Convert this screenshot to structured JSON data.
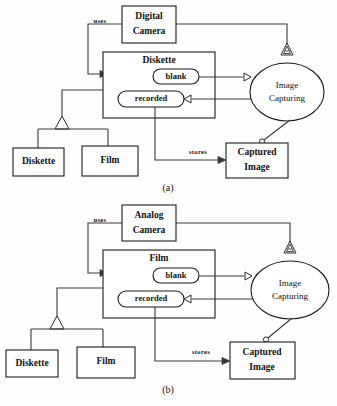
{
  "figure": {
    "type": "uml-object-diagram-pair",
    "panels": [
      {
        "id": "panel-a",
        "caption": "(a)",
        "caption_x": 168,
        "caption_y": 189,
        "nodes": {
          "camera": {
            "label_line1": "Digital",
            "label_line2": "Camera",
            "x": 122,
            "y": 6,
            "w": 54,
            "h": 37
          },
          "container_class": {
            "label": "Diskette",
            "x": 103,
            "y": 52,
            "w": 112,
            "h": 66
          },
          "attr_blank": {
            "label": "blank",
            "x": 153,
            "y": 69,
            "w": 46,
            "h": 15
          },
          "attr_recorded": {
            "label": "recorded",
            "x": 118,
            "y": 91,
            "w": 66,
            "h": 16
          },
          "use_case": {
            "label_line1": "Image",
            "label_line2": "Capturing",
            "cx": 287,
            "cy": 92,
            "rx": 37,
            "ry": 29
          },
          "captured_image": {
            "label_line1": "Captured",
            "label_line2": "Image",
            "x": 226,
            "y": 143,
            "w": 62,
            "h": 35
          },
          "sub_diskette": {
            "label": "Diskette",
            "x": 13,
            "y": 148,
            "w": 51,
            "h": 28
          },
          "sub_film": {
            "label": "Film",
            "x": 82,
            "y": 146,
            "w": 56,
            "h": 30
          }
        },
        "edges": {
          "uses_label": {
            "text": "uses",
            "x": 100,
            "y": 22
          },
          "stores_label": {
            "text": "stores",
            "x": 198,
            "y": 153
          }
        }
      },
      {
        "id": "panel-b",
        "caption": "(b)",
        "caption_x": 168,
        "caption_y": 391,
        "nodes": {
          "camera": {
            "label_line1": "Analog",
            "label_line2": "Camera",
            "x": 122,
            "y": 205,
            "w": 54,
            "h": 36
          },
          "container_class": {
            "label": "Film",
            "x": 103,
            "y": 250,
            "w": 112,
            "h": 68
          },
          "attr_blank": {
            "label": "blank",
            "x": 153,
            "y": 268,
            "w": 46,
            "h": 15
          },
          "attr_recorded": {
            "label": "recorded",
            "x": 118,
            "y": 291,
            "w": 66,
            "h": 16
          },
          "use_case": {
            "label_line1": "Image",
            "label_line2": "Capturing",
            "cx": 290,
            "cy": 290,
            "rx": 39,
            "ry": 29
          },
          "captured_image": {
            "label_line1": "Captured",
            "label_line2": "Image",
            "x": 230,
            "y": 342,
            "w": 65,
            "h": 37
          },
          "sub_diskette": {
            "label": "Diskette",
            "x": 6,
            "y": 350,
            "w": 52,
            "h": 27
          },
          "sub_film": {
            "label": "Film",
            "x": 77,
            "y": 347,
            "w": 58,
            "h": 31
          }
        },
        "edges": {
          "uses_label": {
            "text": "uses",
            "x": 100,
            "y": 221
          },
          "stores_label": {
            "text": "stores",
            "x": 201,
            "y": 353
          }
        }
      }
    ],
    "colors": {
      "background": "#fefefe",
      "stroke": "#1a1a1a",
      "edge_stroke": "#3a3a3a",
      "text": "#111111",
      "fill": "#ffffff"
    }
  }
}
